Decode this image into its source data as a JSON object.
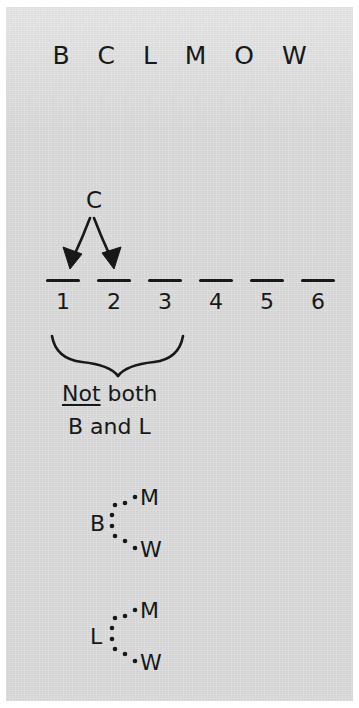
{
  "diagram": {
    "kind": "ordering-logic-puzzle-scratchwork",
    "background_color": "#d2d2d2",
    "ink_color": "#17181a",
    "letter_bank": "B C L M O W",
    "arrow_source_label": "C",
    "arrow_count": 2,
    "arrow_targets": [
      1,
      3
    ],
    "blanks": [
      {
        "number": "1"
      },
      {
        "number": "2"
      },
      {
        "number": "3"
      },
      {
        "number": "4"
      },
      {
        "number": "5"
      },
      {
        "number": "6"
      }
    ],
    "brace": {
      "spans_blanks": [
        1,
        3
      ],
      "direction": "down",
      "caption_line1_emphasis": "Not",
      "caption_line1_rest": " both",
      "caption_line2": "B and L"
    },
    "pair_groups": [
      {
        "name": "b-pair",
        "source": "B",
        "targets": [
          "M",
          "W"
        ],
        "connector": "dotted"
      },
      {
        "name": "l-pair",
        "source": "L",
        "targets": [
          "M",
          "W"
        ],
        "connector": "dotted"
      }
    ]
  }
}
